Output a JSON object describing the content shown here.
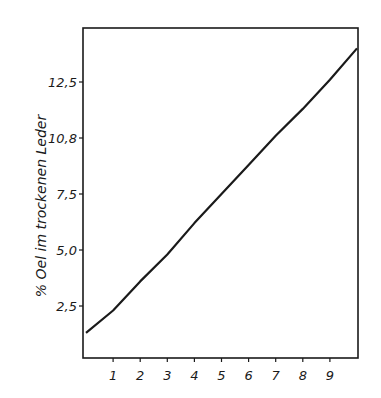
{
  "chart_data": {
    "type": "line",
    "title": "",
    "xlabel": "",
    "ylabel": "% Oel im trockenen Leder",
    "x_ticks": [
      "1",
      "2",
      "3",
      "4",
      "5",
      "6",
      "7",
      "8",
      "9"
    ],
    "y_ticks": [
      {
        "label": "2,5",
        "value": 2.5
      },
      {
        "label": "5,0",
        "value": 5.0
      },
      {
        "label": "7,5",
        "value": 7.5
      },
      {
        "label": "10,8",
        "value": 10.0
      },
      {
        "label": "12,5",
        "value": 12.5
      }
    ],
    "xlim": [
      0,
      10
    ],
    "ylim": [
      0.2,
      14.8
    ],
    "grid": false,
    "legend": null,
    "series": [
      {
        "name": "% Oel",
        "x": [
          0,
          1,
          2,
          3,
          4,
          5,
          6,
          7,
          8,
          9,
          10
        ],
        "values": [
          1.3,
          2.3,
          3.6,
          4.8,
          6.2,
          7.5,
          8.8,
          10.1,
          11.3,
          12.6,
          14.0
        ]
      }
    ]
  },
  "colors": {
    "line": "#1a1a1a",
    "background": "#ffffff"
  }
}
